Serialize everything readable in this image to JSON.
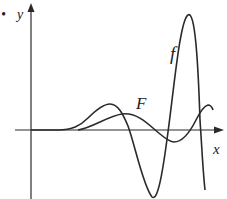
{
  "figure": {
    "bullet": "•",
    "axes": {
      "x_label": "x",
      "y_label": "y"
    },
    "curves": [
      {
        "name": "f",
        "label": "f"
      },
      {
        "name": "F",
        "label": "F"
      }
    ],
    "colors": {
      "stroke": "#2a2a2a",
      "background": "#ffffff"
    }
  }
}
